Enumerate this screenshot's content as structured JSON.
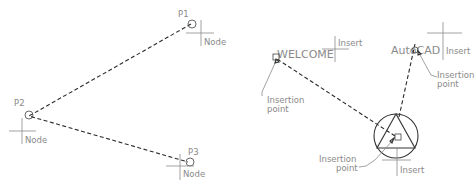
{
  "left_figure": {
    "title": "Node object snap",
    "points": [
      {
        "label": "P1",
        "snap_label": "Node"
      },
      {
        "label": "P2",
        "snap_label": "Node"
      },
      {
        "label": "P3",
        "snap_label": "Node"
      }
    ]
  },
  "right_figure": {
    "title": "Insert object snap",
    "text_welcome": "WELCOME",
    "text_autocad": "AutoCAD",
    "snap_label": "Insert",
    "insertion_point_line1": "Insertion",
    "insertion_point_line2": "point",
    "callouts": [
      {
        "line1": "Insertion",
        "line2": "point"
      },
      {
        "line1": "Insertion",
        "line2": "point"
      },
      {
        "line1": "Insertion",
        "line2": "point"
      }
    ],
    "insert_labels": [
      "Insert",
      "Insert",
      "Insert"
    ]
  },
  "colors": {
    "label": "#8a8a8a",
    "line": "#2a2a2a",
    "background": "#ffffff"
  }
}
